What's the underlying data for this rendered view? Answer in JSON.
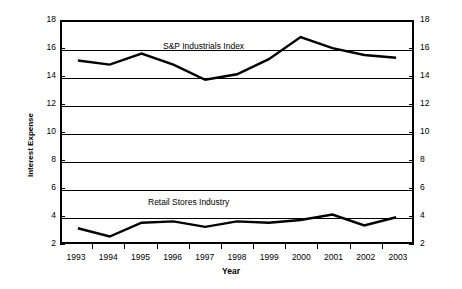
{
  "chart_data": {
    "type": "line",
    "title": "",
    "xlabel": "Year",
    "ylabel": "Interest Expense",
    "categories": [
      "1993",
      "1994",
      "1995",
      "1996",
      "1997",
      "1998",
      "1999",
      "2000",
      "2001",
      "2002",
      "2003"
    ],
    "ylim": [
      2,
      18
    ],
    "ytick_step": 2,
    "yticks": [
      "2",
      "4",
      "6",
      "8",
      "10",
      "12",
      "14",
      "16",
      "18"
    ],
    "grid": true,
    "grid_axis": "y",
    "legend_position": "inline-annotation",
    "dual_y_axis": true,
    "series": [
      {
        "name": "S&P Industrials Index",
        "values": [
          15.2,
          14.9,
          15.7,
          14.9,
          13.8,
          14.2,
          15.3,
          16.9,
          16.1,
          15.6,
          15.4
        ]
      },
      {
        "name": "Retail Stores Industry",
        "values": [
          3.0,
          2.4,
          3.4,
          3.5,
          3.1,
          3.5,
          3.4,
          3.6,
          4.0,
          3.2,
          3.8
        ]
      }
    ]
  },
  "axes": {
    "y_title": "Interest Expense",
    "x_title": "Year"
  },
  "annotations": {
    "sp_label": "S&P Industrials Index",
    "retail_label": "Retail Stores Industry"
  }
}
